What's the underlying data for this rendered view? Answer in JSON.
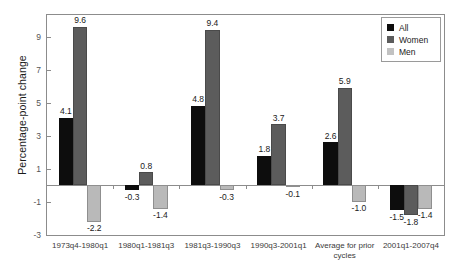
{
  "chart_data": {
    "type": "bar",
    "title": "",
    "subtitle": "",
    "xlabel": "",
    "ylabel": "Percentage-point change",
    "ylim": [
      -3,
      10.3
    ],
    "yticks": [
      9,
      7,
      5,
      3,
      1,
      -1,
      -3
    ],
    "ytick_labels": [
      "9",
      "7",
      "5",
      "3",
      "1",
      "-1",
      "-3"
    ],
    "grid": false,
    "zero_line": true,
    "legend_position": "top-right",
    "categories": [
      "1973q4-1980q1",
      "1980q1-1981q3",
      "1981q3-1990q3",
      "1990q3-2001q1",
      "Average for prior\ncycles",
      "2001q1-2007q4"
    ],
    "series": [
      {
        "name": "All",
        "color": "#0d0d0d",
        "values": [
          4.1,
          -0.3,
          4.8,
          1.8,
          2.6,
          -1.5
        ],
        "labels": [
          "4.1",
          "-0.3",
          "4.8",
          "1.8",
          "2.6",
          "-1.5"
        ]
      },
      {
        "name": "Women",
        "color": "#5c5c5c",
        "values": [
          9.6,
          0.8,
          9.4,
          3.7,
          5.9,
          -1.8
        ],
        "labels": [
          "9.6",
          "0.8",
          "9.4",
          "3.7",
          "5.9",
          "-1.8"
        ]
      },
      {
        "name": "Men",
        "color": "#b9b9b9",
        "values": [
          -2.2,
          -1.4,
          -0.3,
          -0.1,
          -1.0,
          -1.4
        ],
        "labels": [
          "-2.2",
          "-1.4",
          "-0.3",
          "-0.1",
          "-1.0",
          "-1.4"
        ]
      }
    ]
  },
  "legend": {
    "items": [
      {
        "label": "All"
      },
      {
        "label": "Women"
      },
      {
        "label": "Men"
      }
    ]
  },
  "axis": {
    "y_title": "Percentage-point change"
  }
}
